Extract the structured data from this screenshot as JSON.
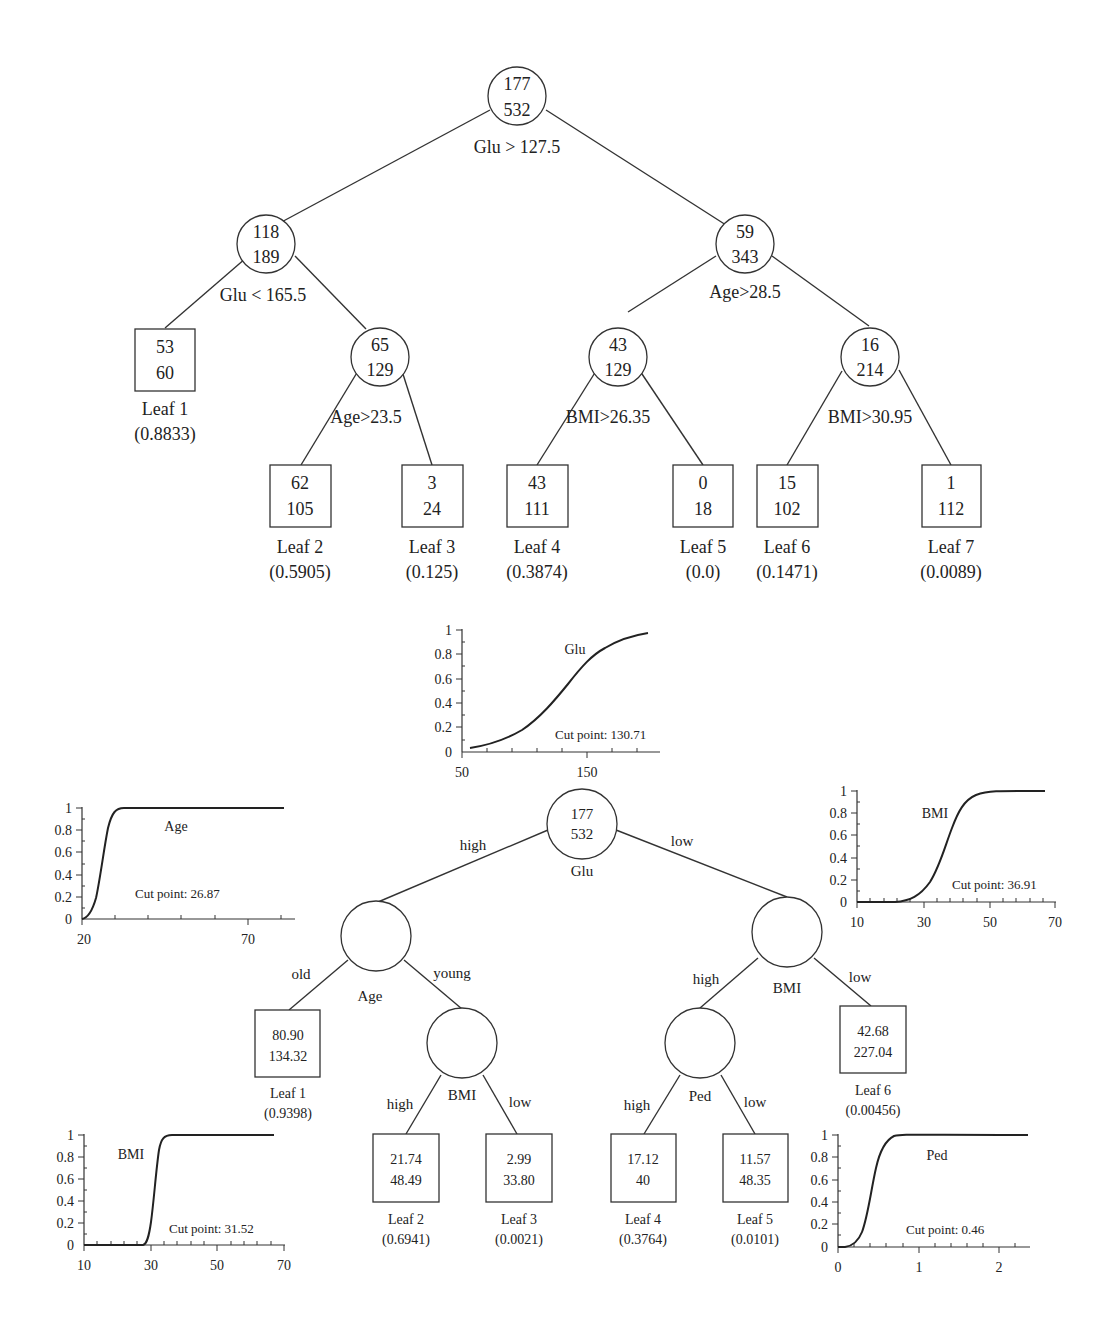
{
  "top_tree": {
    "root": {
      "pos": 177,
      "total": 532,
      "split": "Glu > 127.5"
    },
    "left": {
      "pos": 118,
      "total": 189,
      "split": "Glu < 165.5"
    },
    "right": {
      "pos": 59,
      "total": 343,
      "split": "Age>28.5"
    },
    "left_right": {
      "pos": 65,
      "total": 129,
      "split": "Age>23.5"
    },
    "right_left": {
      "pos": 43,
      "total": 129,
      "split": "BMI>26.35"
    },
    "right_right": {
      "pos": 16,
      "total": 214,
      "split": "BMI>30.95"
    },
    "leaves": [
      {
        "label": "Leaf 1",
        "pos": "53",
        "total": "60",
        "prob": "(0.8833)"
      },
      {
        "label": "Leaf 2",
        "pos": "62",
        "total": "105",
        "prob": "(0.5905)"
      },
      {
        "label": "Leaf 3",
        "pos": "3",
        "total": "24",
        "prob": "(0.125)"
      },
      {
        "label": "Leaf 4",
        "pos": "43",
        "total": "111",
        "prob": "(0.3874)"
      },
      {
        "label": "Leaf 5",
        "pos": "0",
        "total": "18",
        "prob": "(0.0)"
      },
      {
        "label": "Leaf 6",
        "pos": "15",
        "total": "102",
        "prob": "(0.1471)"
      },
      {
        "label": "Leaf 7",
        "pos": "1",
        "total": "112",
        "prob": "(0.0089)"
      }
    ]
  },
  "fuzzy_tree": {
    "root": {
      "pos": "177",
      "total": "532",
      "var": "Glu",
      "edge_left": "high",
      "edge_right": "low"
    },
    "age_node": {
      "var": "Age",
      "edge_left": "old",
      "edge_right": "young"
    },
    "bmi_left_node": {
      "var": "BMI",
      "edge_left": "high",
      "edge_right": "low"
    },
    "bmi_right_node": {
      "var": "BMI",
      "edge_left": "high",
      "edge_right": "low"
    },
    "ped_node": {
      "var": "Ped",
      "edge_left": "high",
      "edge_right": "low"
    },
    "leaves": [
      {
        "label": "Leaf 1",
        "a": "80.90",
        "b": "134.32",
        "prob": "(0.9398)"
      },
      {
        "label": "Leaf 2",
        "a": "21.74",
        "b": "48.49",
        "prob": "(0.6941)"
      },
      {
        "label": "Leaf 3",
        "a": "2.99",
        "b": "33.80",
        "prob": "(0.0021)"
      },
      {
        "label": "Leaf 4",
        "a": "17.12",
        "b": "40",
        "prob": "(0.3764)"
      },
      {
        "label": "Leaf 5",
        "a": "11.57",
        "b": "48.35",
        "prob": "(0.0101)"
      },
      {
        "label": "Leaf 6",
        "a": "42.68",
        "b": "227.04",
        "prob": "(0.00456)"
      }
    ]
  },
  "membership_plots": {
    "glu": {
      "name": "Glu",
      "cut": "Cut point: 130.71",
      "xticks": [
        "50",
        "150"
      ],
      "yticks": [
        "0",
        "0.2",
        "0.4",
        "0.6",
        "0.8",
        "1"
      ]
    },
    "age": {
      "name": "Age",
      "cut": "Cut point: 26.87",
      "xticks": [
        "20",
        "70"
      ],
      "yticks": [
        "0",
        "0.2",
        "0.4",
        "0.6",
        "0.8",
        "1"
      ]
    },
    "bmi_right": {
      "name": "BMI",
      "cut": "Cut point: 36.91",
      "xticks": [
        "10",
        "30",
        "50",
        "70"
      ],
      "yticks": [
        "0",
        "0.2",
        "0.4",
        "0.6",
        "0.8",
        "1"
      ]
    },
    "bmi_left": {
      "name": "BMI",
      "cut": "Cut point: 31.52",
      "xticks": [
        "10",
        "30",
        "50",
        "70"
      ],
      "yticks": [
        "0",
        "0.2",
        "0.4",
        "0.6",
        "0.8",
        "1"
      ]
    },
    "ped": {
      "name": "Ped",
      "cut": "Cut point: 0.46",
      "xticks": [
        "0",
        "1",
        "2"
      ],
      "yticks": [
        "0",
        "0.2",
        "0.4",
        "0.6",
        "0.8",
        "1"
      ]
    }
  }
}
